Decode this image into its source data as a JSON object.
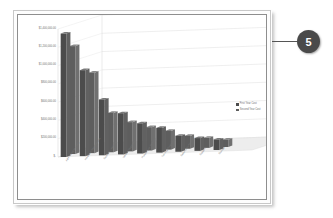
{
  "slide": {
    "background_color": "#ffffff",
    "frame_color": "#8e8e8e"
  },
  "callout": {
    "number": "5",
    "badge_color": "#4a4a4a",
    "line_color": "#555555"
  },
  "chart_data": {
    "type": "bar",
    "title": "",
    "subtitle": "",
    "xlabel": "",
    "ylabel": "",
    "grid": true,
    "three_d": true,
    "legend_position": "right",
    "ylim": [
      0,
      1400000
    ],
    "ytick_labels": [
      "$1,400,000.00",
      "$1,200,000.00",
      "$1,000,000.00",
      "$800,000.00",
      "$600,000.00",
      "$400,000.00",
      "$200,000.00",
      "$-"
    ],
    "ytick_values": [
      1400000,
      1200000,
      1000000,
      800000,
      600000,
      400000,
      200000,
      0
    ],
    "categories": [
      "Administrative Costs",
      "Hardware Replacement",
      "Software Licensing",
      "Network Upgrades",
      "Professional Services",
      "Training Programs",
      "Security Compliance",
      "Support",
      "Storage"
    ],
    "series": [
      {
        "name": "First Year Cost",
        "color": "#4c4c4c",
        "values": [
          1350000,
          940000,
          610000,
          450000,
          330000,
          270000,
          175000,
          140000,
          115000
        ]
      },
      {
        "name": "Second Year Cost",
        "color": "#5e5e5e",
        "values": [
          1180000,
          880000,
          430000,
          320000,
          255000,
          205000,
          140000,
          110000,
          80000
        ]
      }
    ]
  }
}
